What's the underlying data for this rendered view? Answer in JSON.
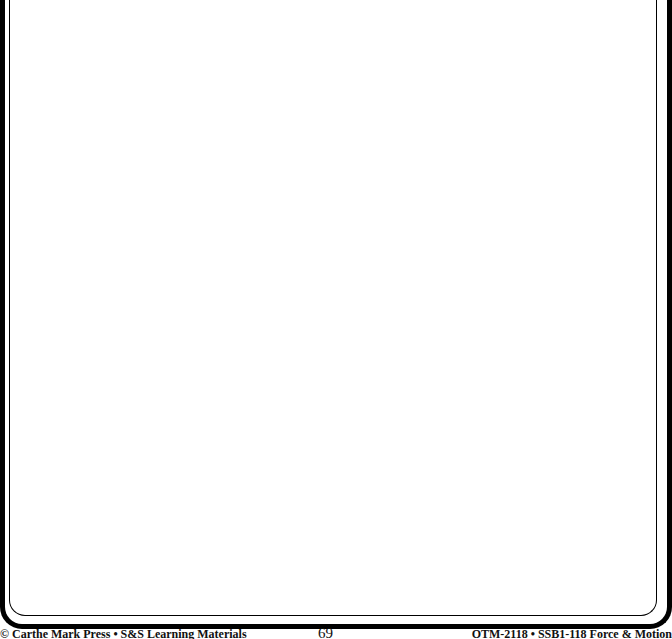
{
  "page": {
    "content_area": "blank bordered page",
    "footer": {
      "left": "© Carthe Mark Press • S&S Learning Materials",
      "page_number": "69",
      "right": "OTM-2118 • SSB1-118 Force & Motion"
    }
  }
}
